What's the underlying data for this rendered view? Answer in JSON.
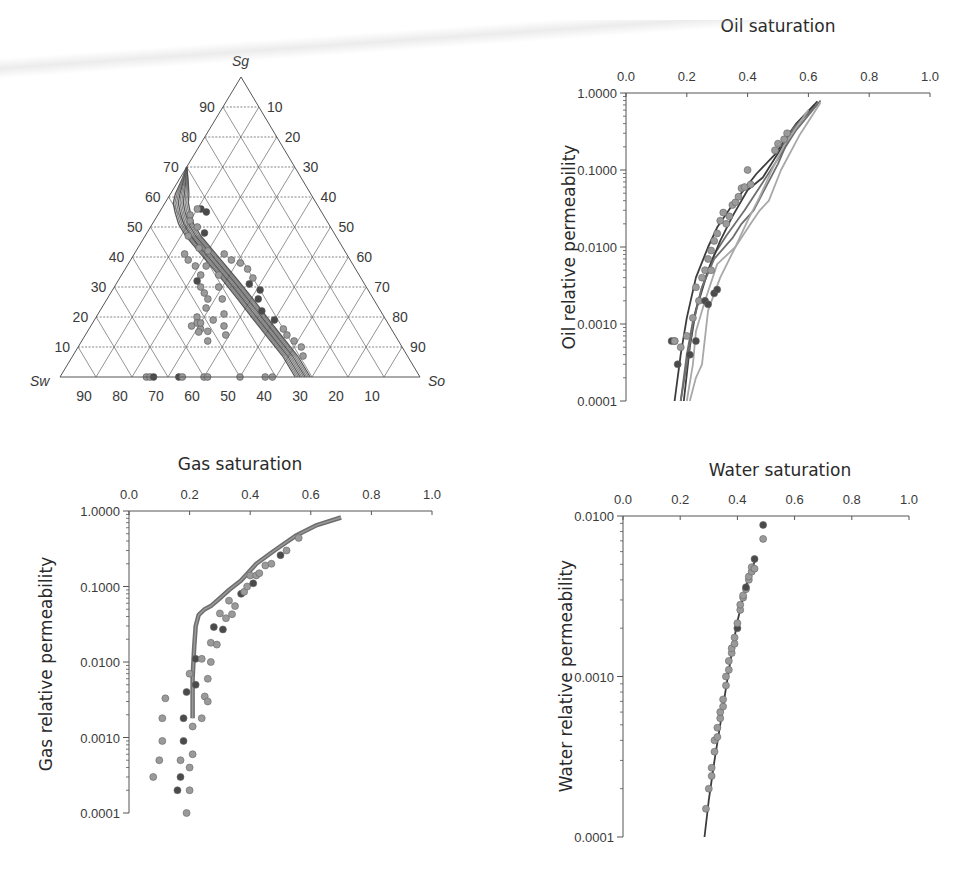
{
  "figure": {
    "panels": [
      {
        "id": "ternary",
        "title": "Ternary saturation diagram"
      },
      {
        "id": "oil",
        "title": "Oil saturation",
        "ylabel": "Oil relative permeability"
      },
      {
        "id": "gas",
        "title": "Gas saturation",
        "ylabel": "Gas relative permeability"
      },
      {
        "id": "water",
        "title": "Water saturation",
        "ylabel": "Water relative permeability"
      }
    ]
  },
  "colors": {
    "axis": "#555555",
    "grid": "#666666",
    "curve": "#6e6e6e",
    "curve_dark": "#3c3c3c",
    "curve_light": "#a8a8a8",
    "point_light": "#9a9a9a",
    "point_dark": "#4a4a4a"
  },
  "chart_data": [
    {
      "type": "scatter",
      "subtype": "ternary",
      "title": "",
      "vertex_labels": {
        "top": "Sg",
        "left": "Sw",
        "right": "So"
      },
      "tick_labels": {
        "sg_left_side": [
          "10",
          "20",
          "30",
          "40",
          "50",
          "60",
          "70",
          "80",
          "90"
        ],
        "so_right_side": [
          "90",
          "80",
          "70",
          "60",
          "50",
          "40",
          "30",
          "20",
          "10"
        ],
        "sw_bottom": [
          "90",
          "80",
          "70",
          "60",
          "50",
          "40",
          "30",
          "20",
          "10"
        ]
      },
      "grid": true,
      "simulated_curve_band": {
        "description": "Bundle of gray simulated saturation paths",
        "path_sw_so_sg": [
          [
            0.3,
            0.0,
            0.7
          ],
          [
            0.33,
            0.01,
            0.66
          ],
          [
            0.37,
            0.02,
            0.61
          ],
          [
            0.39,
            0.03,
            0.58
          ],
          [
            0.4,
            0.05,
            0.55
          ],
          [
            0.41,
            0.08,
            0.51
          ],
          [
            0.41,
            0.12,
            0.47
          ],
          [
            0.4,
            0.18,
            0.42
          ],
          [
            0.39,
            0.24,
            0.37
          ],
          [
            0.38,
            0.3,
            0.32
          ],
          [
            0.37,
            0.37,
            0.26
          ],
          [
            0.36,
            0.45,
            0.19
          ],
          [
            0.35,
            0.52,
            0.13
          ],
          [
            0.34,
            0.59,
            0.07
          ],
          [
            0.34,
            0.66,
            0.0
          ]
        ],
        "band_width_so": 0.07,
        "line_count": 10
      },
      "points_sw_so_sg": [
        [
          0.33,
          0.11,
          0.56
        ],
        [
          0.32,
          0.13,
          0.55
        ],
        [
          0.34,
          0.1,
          0.56
        ],
        [
          0.37,
          0.09,
          0.54
        ],
        [
          0.38,
          0.1,
          0.52
        ],
        [
          0.37,
          0.13,
          0.5
        ],
        [
          0.36,
          0.16,
          0.48
        ],
        [
          0.41,
          0.12,
          0.47
        ],
        [
          0.4,
          0.17,
          0.43
        ],
        [
          0.38,
          0.2,
          0.42
        ],
        [
          0.34,
          0.25,
          0.41
        ],
        [
          0.33,
          0.28,
          0.39
        ],
        [
          0.31,
          0.31,
          0.38
        ],
        [
          0.3,
          0.34,
          0.36
        ],
        [
          0.3,
          0.37,
          0.33
        ],
        [
          0.32,
          0.37,
          0.31
        ],
        [
          0.3,
          0.41,
          0.29
        ],
        [
          0.32,
          0.42,
          0.26
        ],
        [
          0.33,
          0.45,
          0.22
        ],
        [
          0.31,
          0.5,
          0.19
        ],
        [
          0.3,
          0.54,
          0.16
        ],
        [
          0.3,
          0.56,
          0.14
        ],
        [
          0.29,
          0.59,
          0.12
        ],
        [
          0.28,
          0.62,
          0.1
        ],
        [
          0.29,
          0.64,
          0.07
        ],
        [
          0.45,
          0.14,
          0.41
        ],
        [
          0.45,
          0.16,
          0.39
        ],
        [
          0.44,
          0.19,
          0.37
        ],
        [
          0.44,
          0.22,
          0.34
        ],
        [
          0.46,
          0.24,
          0.3
        ],
        [
          0.46,
          0.26,
          0.28
        ],
        [
          0.46,
          0.28,
          0.26
        ],
        [
          0.48,
          0.29,
          0.23
        ],
        [
          0.52,
          0.28,
          0.2
        ],
        [
          0.53,
          0.29,
          0.18
        ],
        [
          0.53,
          0.31,
          0.16
        ],
        [
          0.53,
          0.35,
          0.12
        ],
        [
          0.46,
          0.22,
          0.32
        ],
        [
          0.41,
          0.22,
          0.37
        ],
        [
          0.39,
          0.27,
          0.34
        ],
        [
          0.41,
          0.29,
          0.3
        ],
        [
          0.42,
          0.32,
          0.26
        ],
        [
          0.44,
          0.35,
          0.21
        ],
        [
          0.46,
          0.37,
          0.17
        ],
        [
          0.47,
          0.39,
          0.14
        ],
        [
          0.52,
          0.3,
          0.18
        ],
        [
          0.53,
          0.31,
          0.19
        ],
        [
          0.55,
          0.28,
          0.17
        ],
        [
          0.54,
          0.31,
          0.15
        ],
        [
          0.48,
          0.33,
          0.19
        ],
        [
          0.76,
          0.24,
          0.0
        ],
        [
          0.75,
          0.25,
          0.0
        ],
        [
          0.74,
          0.26,
          0.0
        ],
        [
          0.67,
          0.33,
          0.0
        ],
        [
          0.66,
          0.34,
          0.0
        ],
        [
          0.6,
          0.4,
          0.0
        ],
        [
          0.59,
          0.41,
          0.0
        ],
        [
          0.5,
          0.5,
          0.0
        ],
        [
          0.43,
          0.57,
          0.0
        ],
        [
          0.41,
          0.59,
          0.0
        ]
      ],
      "dark_point_indices": [
        0,
        1,
        6,
        15,
        16,
        17,
        18,
        19,
        37,
        52,
        53
      ]
    },
    {
      "type": "line",
      "title": "Oil saturation",
      "xlabel": "Oil saturation",
      "ylabel": "Oil relative permeability",
      "xlim": [
        0.0,
        1.0
      ],
      "xticks": [
        "0.0",
        "0.2",
        "0.4",
        "0.6",
        "0.8",
        "1.0"
      ],
      "yscale": "log",
      "ylim": [
        0.0001,
        1.0
      ],
      "yticks": [
        "1.0000",
        "0.1000",
        "0.0100",
        "0.0010",
        "0.0001"
      ],
      "series": [
        {
          "name": "sim-1",
          "shade": "dark",
          "x": [
            0.16,
            0.18,
            0.2,
            0.23,
            0.27,
            0.3,
            0.36,
            0.43,
            0.49,
            0.56,
            0.63
          ],
          "y": [
            0.0001,
            0.0004,
            0.0012,
            0.004,
            0.01,
            0.018,
            0.04,
            0.09,
            0.16,
            0.4,
            0.78
          ]
        },
        {
          "name": "sim-2",
          "shade": "mid",
          "x": [
            0.18,
            0.2,
            0.22,
            0.25,
            0.29,
            0.33,
            0.39,
            0.44,
            0.5,
            0.56,
            0.64
          ],
          "y": [
            0.0001,
            0.0004,
            0.0011,
            0.003,
            0.008,
            0.014,
            0.03,
            0.06,
            0.14,
            0.33,
            0.8
          ]
        },
        {
          "name": "sim-3",
          "shade": "light",
          "x": [
            0.2,
            0.22,
            0.23,
            0.26,
            0.3,
            0.36,
            0.41,
            0.44,
            0.47,
            0.51,
            0.57,
            0.64
          ],
          "y": [
            0.0001,
            0.0003,
            0.0008,
            0.002,
            0.006,
            0.01,
            0.02,
            0.03,
            0.04,
            0.1,
            0.28,
            0.75
          ]
        },
        {
          "name": "sim-4",
          "shade": "dark",
          "x": [
            0.19,
            0.21,
            0.23,
            0.27,
            0.31,
            0.35,
            0.4,
            0.45,
            0.51,
            0.58,
            0.62
          ],
          "y": [
            0.0001,
            0.0005,
            0.0015,
            0.005,
            0.012,
            0.025,
            0.055,
            0.08,
            0.19,
            0.46,
            0.7
          ]
        },
        {
          "name": "sim-5",
          "shade": "mid",
          "x": [
            0.18,
            0.2,
            0.22,
            0.25,
            0.29,
            0.35,
            0.38,
            0.42,
            0.46,
            0.5,
            0.55,
            0.63
          ],
          "y": [
            0.0001,
            0.0003,
            0.001,
            0.003,
            0.007,
            0.013,
            0.02,
            0.03,
            0.06,
            0.12,
            0.35,
            0.72
          ]
        },
        {
          "name": "sim-6",
          "shade": "light",
          "x": [
            0.21,
            0.23,
            0.25,
            0.27,
            0.31,
            0.36,
            0.4,
            0.44,
            0.48,
            0.52,
            0.6
          ],
          "y": [
            0.0001,
            0.0002,
            0.0003,
            0.0015,
            0.004,
            0.01,
            0.022,
            0.045,
            0.1,
            0.21,
            0.6
          ]
        }
      ],
      "points": {
        "x": [
          0.15,
          0.16,
          0.17,
          0.18,
          0.2,
          0.22,
          0.23,
          0.24,
          0.25,
          0.26,
          0.27,
          0.28,
          0.29,
          0.3,
          0.31,
          0.32,
          0.33,
          0.34,
          0.35,
          0.36,
          0.37,
          0.38,
          0.39,
          0.4,
          0.41,
          0.49,
          0.5,
          0.52,
          0.53,
          0.21,
          0.23,
          0.26,
          0.27,
          0.29,
          0.3,
          0.16,
          0.28
        ],
        "y": [
          0.0006,
          0.0006,
          0.0003,
          0.0005,
          0.0007,
          0.0012,
          0.003,
          0.002,
          0.004,
          0.005,
          0.007,
          0.009,
          0.012,
          0.015,
          0.022,
          0.028,
          0.02,
          0.025,
          0.035,
          0.038,
          0.045,
          0.058,
          0.06,
          0.1,
          0.065,
          0.18,
          0.22,
          0.25,
          0.3,
          0.0004,
          0.0006,
          0.002,
          0.0018,
          0.0025,
          0.0028,
          0.0006,
          0.005
        ],
        "dark_indices": [
          0,
          2,
          29,
          30,
          31,
          32,
          33,
          34
        ]
      }
    },
    {
      "type": "line",
      "title": "Gas saturation",
      "xlabel": "Gas saturation",
      "ylabel": "Gas relative permeability",
      "xlim": [
        0.0,
        1.0
      ],
      "xticks": [
        "0.0",
        "0.2",
        "0.4",
        "0.6",
        "0.8",
        "1.0"
      ],
      "yscale": "log",
      "ylim": [
        0.0001,
        1.0
      ],
      "yticks": [
        "1.0000",
        "0.1000",
        "0.0100",
        "0.0010",
        "0.0001"
      ],
      "series": [
        {
          "name": "sim-band",
          "shade": "mid",
          "x": [
            0.21,
            0.21,
            0.215,
            0.22,
            0.23,
            0.25,
            0.27,
            0.3,
            0.33,
            0.37,
            0.42,
            0.48,
            0.55,
            0.62,
            0.7
          ],
          "y": [
            0.0018,
            0.006,
            0.015,
            0.03,
            0.042,
            0.05,
            0.055,
            0.07,
            0.09,
            0.12,
            0.2,
            0.3,
            0.47,
            0.65,
            0.82
          ]
        }
      ],
      "points": {
        "x": [
          0.08,
          0.1,
          0.11,
          0.11,
          0.12,
          0.16,
          0.17,
          0.17,
          0.18,
          0.18,
          0.19,
          0.19,
          0.2,
          0.2,
          0.2,
          0.21,
          0.21,
          0.22,
          0.22,
          0.24,
          0.24,
          0.25,
          0.26,
          0.26,
          0.27,
          0.27,
          0.28,
          0.29,
          0.3,
          0.31,
          0.32,
          0.33,
          0.34,
          0.35,
          0.37,
          0.38,
          0.39,
          0.4,
          0.41,
          0.42,
          0.43,
          0.45,
          0.47,
          0.5,
          0.52,
          0.56
        ],
        "y": [
          0.0003,
          0.0005,
          0.0009,
          0.0018,
          0.0033,
          0.0002,
          0.0003,
          0.0005,
          0.0009,
          0.0018,
          0.0001,
          0.004,
          0.0002,
          0.0004,
          0.007,
          0.0006,
          0.0014,
          0.005,
          0.011,
          0.0018,
          0.011,
          0.0035,
          0.003,
          0.006,
          0.018,
          0.01,
          0.029,
          0.017,
          0.044,
          0.027,
          0.038,
          0.065,
          0.043,
          0.055,
          0.08,
          0.085,
          0.1,
          0.14,
          0.11,
          0.14,
          0.15,
          0.19,
          0.2,
          0.26,
          0.3,
          0.44
        ],
        "dark_indices": [
          5,
          6,
          8,
          9,
          11,
          17,
          18,
          26,
          29,
          34,
          38,
          43
        ]
      }
    },
    {
      "type": "line",
      "title": "Water saturation",
      "xlabel": "Water saturation",
      "ylabel": "Water relative permeability",
      "xlim": [
        0.0,
        1.0
      ],
      "xticks": [
        "0.0",
        "0.2",
        "0.4",
        "0.6",
        "0.8",
        "1.0"
      ],
      "yscale": "log",
      "ylim": [
        0.0001,
        0.01
      ],
      "yticks": [
        "0.0100",
        "0.0010",
        "0.0001"
      ],
      "series": [
        {
          "name": "sim-line",
          "shade": "dark",
          "x": [
            0.285,
            0.3,
            0.32,
            0.34,
            0.36,
            0.38,
            0.4,
            0.42,
            0.44,
            0.46
          ],
          "y": [
            0.0001,
            0.00017,
            0.0003,
            0.0005,
            0.00085,
            0.0014,
            0.0022,
            0.0031,
            0.0042,
            0.0052
          ]
        }
      ],
      "points": {
        "x": [
          0.29,
          0.3,
          0.31,
          0.31,
          0.32,
          0.32,
          0.33,
          0.33,
          0.34,
          0.34,
          0.35,
          0.35,
          0.36,
          0.36,
          0.37,
          0.37,
          0.38,
          0.38,
          0.39,
          0.39,
          0.4,
          0.4,
          0.41,
          0.41,
          0.42,
          0.42,
          0.43,
          0.43,
          0.44,
          0.44,
          0.45,
          0.45,
          0.46,
          0.46,
          0.49,
          0.49
        ],
        "y": [
          0.00015,
          0.0002,
          0.00024,
          0.00027,
          0.00034,
          0.0004,
          0.00042,
          0.00048,
          0.00055,
          0.0006,
          0.00065,
          0.00072,
          0.00088,
          0.001,
          0.0011,
          0.00125,
          0.0014,
          0.0015,
          0.0016,
          0.00175,
          0.002,
          0.00215,
          0.0026,
          0.0028,
          0.0031,
          0.0032,
          0.0035,
          0.0036,
          0.004,
          0.0042,
          0.0045,
          0.0048,
          0.0047,
          0.0054,
          0.0072,
          0.0088
        ],
        "dark_indices": [
          20,
          27,
          33,
          35
        ]
      }
    }
  ]
}
